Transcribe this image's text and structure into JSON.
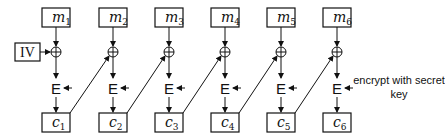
{
  "diagram": {
    "iv_label": "IV",
    "encrypt_label": "E",
    "note_line1": "encrypt with secret",
    "note_line2": "key",
    "blocks": [
      {
        "m": "m",
        "m_sub": "1",
        "c": "c",
        "c_sub": "1"
      },
      {
        "m": "m",
        "m_sub": "2",
        "c": "c",
        "c_sub": "2"
      },
      {
        "m": "m",
        "m_sub": "3",
        "c": "c",
        "c_sub": "3"
      },
      {
        "m": "m",
        "m_sub": "4",
        "c": "c",
        "c_sub": "4"
      },
      {
        "m": "m",
        "m_sub": "5",
        "c": "c",
        "c_sub": "5"
      },
      {
        "m": "m",
        "m_sub": "6",
        "c": "c",
        "c_sub": "6"
      }
    ],
    "colors": {
      "stroke": "#111111",
      "background": "#ffffff"
    }
  }
}
